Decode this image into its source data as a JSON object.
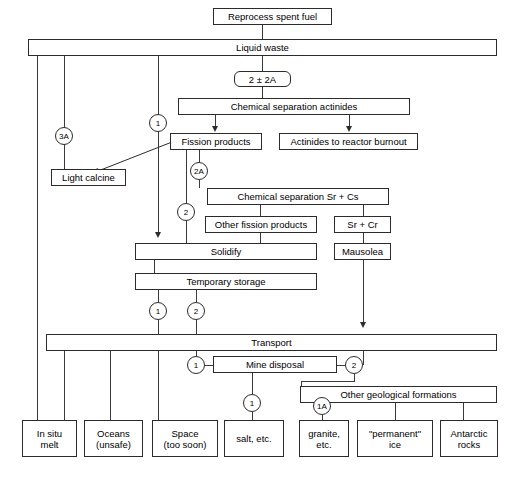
{
  "diagram": {
    "nodes": {
      "reprocess": "Reprocess spent fuel",
      "liquid_waste": "Liquid waste",
      "two_pm_2a": "2 ± 2A",
      "chem_sep_actinides": "Chemical separation actinides",
      "fission_products": "Fission products",
      "actinides_burnout": "Actinides to reactor burnout",
      "light_calcine": "Light calcine",
      "chem_sep_srcs": "Chemical separation Sr + Cs",
      "other_fission_products": "Other fission products",
      "sr_cr": "Sr + Cr",
      "solidify": "Solidify",
      "mausolea": "Mausolea",
      "temporary_storage": "Temporary storage",
      "transport": "Transport",
      "mine_disposal": "Mine disposal",
      "other_geological": "Other geological formations",
      "in_situ_melt": "In situ\nmelt",
      "oceans": "Oceans\n(unsafe)",
      "space": "Space\n(too soon)",
      "salt": "salt, etc.",
      "granite": "granite,\netc.",
      "permanent_ice": "\"permanent\"\nice",
      "antarctic_rocks": "Antarctic\nrocks"
    },
    "tags": {
      "t_3a": "3A",
      "t_1_top": "1",
      "t_2a": "2A",
      "t_2_mid": "2",
      "t_1_storage": "1",
      "t_2_storage": "2",
      "t_1_mine_left": "1",
      "t_2_mine_right": "2",
      "t_1_salt": "1",
      "t_1a_granite": "1A"
    },
    "colors": {
      "stroke": "#2b2b2b",
      "background": "#ffffff",
      "text": "#000000"
    }
  }
}
